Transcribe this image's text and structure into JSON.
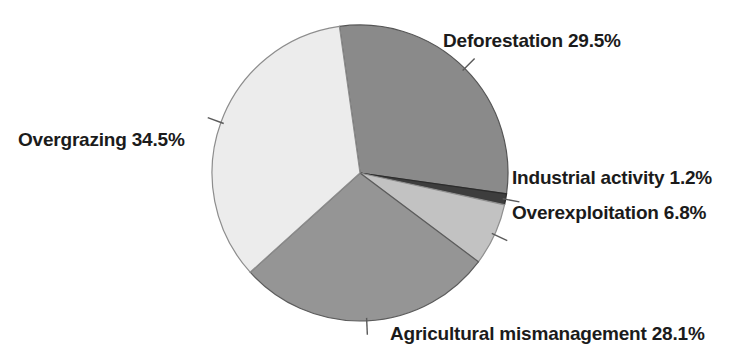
{
  "chart_data": {
    "type": "pie",
    "title": "",
    "subtitle": "",
    "xlabel": "",
    "ylabel": "",
    "grid": false,
    "legend_position": "none",
    "labels_position": "outside-with-leader-lines",
    "total_percent": 100.1,
    "start_angle_deg": 352,
    "direction": "clockwise",
    "center": {
      "x": 360,
      "y": 173
    },
    "radius": 148,
    "categories": [
      "Deforestation",
      "Industrial activity",
      "Overexploitation",
      "Agricultural mismanagement",
      "Overgrazing"
    ],
    "values": [
      29.5,
      1.2,
      6.8,
      28.1,
      34.5
    ],
    "slices": [
      {
        "name": "Deforestation",
        "value": 29.5,
        "value_text": "29.5%",
        "label": "Deforestation 29.5%",
        "color": "#8a8a8a",
        "stroke": "#555555"
      },
      {
        "name": "Industrial activity",
        "value": 1.2,
        "value_text": "1.2%",
        "label": "Industrial activity 1.2%",
        "color": "#3d3d3d",
        "stroke": "#2b2b2b"
      },
      {
        "name": "Overexploitation",
        "value": 6.8,
        "value_text": "6.8%",
        "label": "Overexploitation 6.8%",
        "color": "#c2c2c2",
        "stroke": "#8f8f8f"
      },
      {
        "name": "Agricultural mismanagement",
        "value": 28.1,
        "value_text": "28.1%",
        "label": "Agricultural mismanagement 28.1%",
        "color": "#959595",
        "stroke": "#5c5c5c"
      },
      {
        "name": "Overgrazing",
        "value": 34.5,
        "value_text": "34.5%",
        "label": "Overgrazing 34.5%",
        "color": "#ececec",
        "stroke": "#8d8d8d"
      }
    ]
  },
  "labels": {
    "deforestation": "Deforestation 29.5%",
    "overgrazing": "Overgrazing 34.5%",
    "industrial": "Industrial activity 1.2%",
    "overexploitation": "Overexploitation 6.8%",
    "agricultural": "Agricultural mismanagement 28.1%"
  },
  "colors": {
    "background": "#ffffff",
    "text": "#1b1b1b",
    "leader_line": "#5a5a5a",
    "slice_deforestation": "#8a8a8a",
    "slice_industrial": "#3d3d3d",
    "slice_overexploitation": "#c2c2c2",
    "slice_agricultural": "#959595",
    "slice_overgrazing": "#ececec"
  }
}
